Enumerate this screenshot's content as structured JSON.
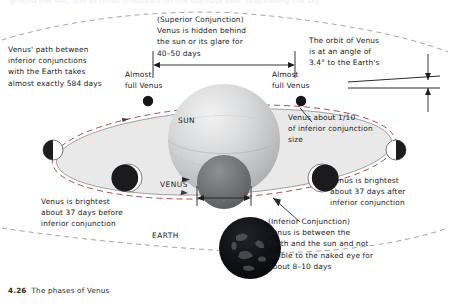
{
  "figure": {
    "caption_number": "4.26",
    "caption_text": "The phases of Venus",
    "top_cut_text": "ground the sun, and at times it appears on the opposite side, brightening the sky"
  },
  "bodies": {
    "sun_label": "SUN",
    "venus_label": "VENUS",
    "earth_label": "EARTH",
    "sun_color": "#c9cacb",
    "venus_color": "#6f7173",
    "earth_color": "#0d0d0f",
    "orbit_fill": "#e8e8e9",
    "orbit_dash_color": "#b03a3a",
    "orbit_line_color": "#8d8d90"
  },
  "annotations": {
    "left_orbit_period": "Venus' path between\ninferior conjunctions\nwith the Earth takes\nalmost exactly 584 days",
    "superior_conjunction": "(Superior Conjunction)\nVenus is hidden behind\nthe sun or its glare for\n40–50 days",
    "orbit_angle": "The orbit of Venus\nis at an angle of\n3.4° to the Earth's",
    "almost_full_left": "Almost\nfull Venus",
    "almost_full_right": "Almost\nfull Venus",
    "venus_size_ratio": "Venus about 1/10\nof inferior conjunction\nsize",
    "brightest_before": "Venus is brightest\nabout 37 days before\ninferior conjunction",
    "brightest_after": "Venus is brightest\nabout 37 days after\ninferior conjunction",
    "inferior_conjunction": "(Inferior Conjunction)\nVenus is between the\nEarth and the sun and not\nvisible to the naked eye for\nabout 8–10 days"
  },
  "measurements": {
    "superior_conjunction_days": "40–50 days",
    "orbit_period_days": "584 days",
    "orbit_inclination": "3.4°",
    "brightest_offset_days": "37 days",
    "inferior_conjunction_days": "8–10 days",
    "relative_size": "1/10"
  }
}
